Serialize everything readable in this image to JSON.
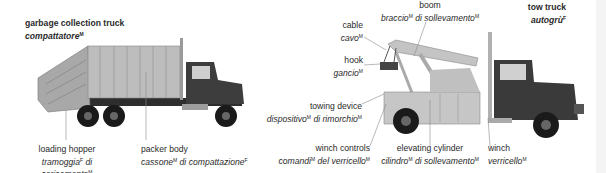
{
  "garbage_truck": {
    "title": {
      "en": "garbage collection truck",
      "it": "compattatore",
      "gender": "M"
    },
    "parts": [
      {
        "en": "loading hopper",
        "it1": "tramoggia",
        "g1": "F",
        "it2": " di",
        "it3": "caricamento",
        "g3": "M"
      },
      {
        "en": "packer body",
        "it1": "cassone",
        "g1": "M",
        "it2": " di compattazione",
        "g2": "F"
      }
    ]
  },
  "tow_truck": {
    "title": {
      "en": "tow truck",
      "it": "autogrù",
      "gender": "F"
    },
    "parts": [
      {
        "en": "boom",
        "it1": "braccio",
        "g1": "M",
        "it2": " di sollevamento",
        "g2": "M"
      },
      {
        "en": "cable",
        "it1": "cavo",
        "g1": "M"
      },
      {
        "en": "hook",
        "it1": "gancio",
        "g1": "M"
      },
      {
        "en": "towing device",
        "it1": "dispositivo",
        "g1": "M",
        "it2": " di rimorchio",
        "g2": "M"
      },
      {
        "en": "winch controls",
        "it1": "comandi",
        "g1": "M",
        "it2": " del verricello",
        "g2": "M"
      },
      {
        "en": "elevating cylinder",
        "it1": "cilindro",
        "g1": "M",
        "it2": " di sollevamento",
        "g2": "M"
      },
      {
        "en": "winch",
        "it1": "verricello",
        "g1": "M"
      }
    ]
  },
  "colors": {
    "body_light": "#b5b5b5",
    "cab_dark": "#3a3a3a",
    "tire": "#1a1a1a",
    "leader": "#8a8a8a"
  }
}
